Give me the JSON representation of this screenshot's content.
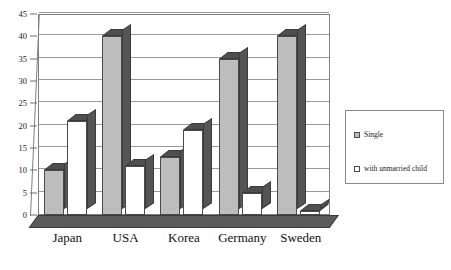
{
  "chart_data": {
    "type": "bar",
    "title": "",
    "subtitle": "",
    "xlabel": "",
    "ylabel": "",
    "categories": [
      "Japan",
      "USA",
      "Korea",
      "Germany",
      "Sweden"
    ],
    "series": [
      {
        "name": "Single",
        "values": [
          10,
          40,
          13,
          35,
          40
        ],
        "color": "#bdbdbd"
      },
      {
        "name": "with unmarried child",
        "values": [
          21,
          11,
          19,
          5,
          1
        ],
        "color": "#ffffff"
      }
    ],
    "ylim": [
      0,
      45
    ],
    "ytick_step": 5,
    "yticks": [
      "45",
      "40",
      "35",
      "30",
      "25",
      "20",
      "15",
      "10",
      "5",
      "0"
    ],
    "grid": true,
    "legend_position": "right",
    "style": "3d-column",
    "annotations": []
  },
  "legend": {
    "items": [
      {
        "label": "Single",
        "swatch": "single"
      },
      {
        "label": "with unmarried child",
        "swatch": "child"
      }
    ]
  },
  "colors": {
    "bar_single": "#bdbdbd",
    "bar_child": "#ffffff",
    "bar_side": "#555555",
    "grid": "#9a9a9a",
    "frame": "#808080",
    "floor": "#5a5a5a",
    "text": "#101010"
  }
}
